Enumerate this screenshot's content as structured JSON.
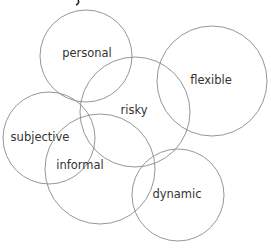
{
  "diagram": {
    "type": "overlapping-circles",
    "colors": {
      "stroke": "#8a8a8a",
      "text": "#333333",
      "background": "#ffffff"
    },
    "nodes": [
      {
        "id": "personal",
        "label": "personal"
      },
      {
        "id": "flexible",
        "label": "flexible"
      },
      {
        "id": "risky",
        "label": "risky"
      },
      {
        "id": "subjective",
        "label": "subjective"
      },
      {
        "id": "informal",
        "label": "informal"
      },
      {
        "id": "dynamic",
        "label": "dynamic"
      }
    ]
  }
}
